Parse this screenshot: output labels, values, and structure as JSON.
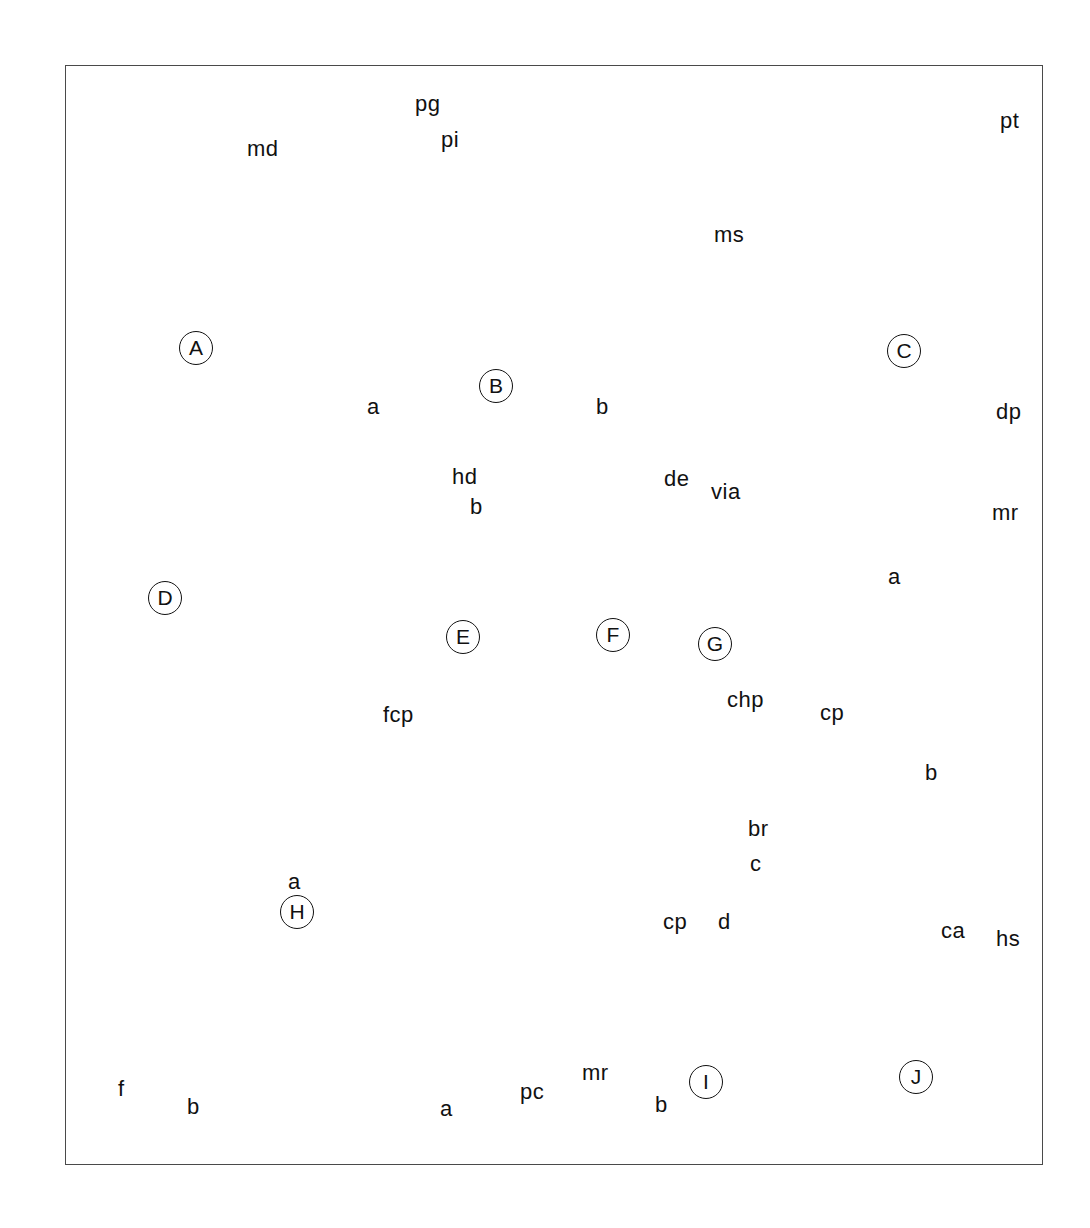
{
  "plate": {
    "title": "Fossil brachiopod / bivalve illustration plate",
    "frame": {
      "x": 65,
      "y": 65,
      "width": 978,
      "height": 1100,
      "border_color": "#4a4a4a"
    },
    "background_color": "#ffffff",
    "ink_color": "#111111"
  },
  "panels": [
    {
      "id": "A",
      "letter": "A",
      "x": 196,
      "y": 348,
      "sublabels": []
    },
    {
      "id": "B",
      "letter": "B",
      "x": 496,
      "y": 386,
      "sublabels": [
        {
          "text": "a",
          "x": 367,
          "y": 405
        },
        {
          "text": "b",
          "x": 596,
          "y": 405
        }
      ]
    },
    {
      "id": "C",
      "letter": "C",
      "x": 904,
      "y": 351,
      "sublabels": []
    },
    {
      "id": "D",
      "letter": "D",
      "x": 165,
      "y": 598,
      "sublabels": []
    },
    {
      "id": "E",
      "letter": "E",
      "x": 463,
      "y": 637,
      "sublabels": []
    },
    {
      "id": "F",
      "letter": "F",
      "x": 613,
      "y": 635,
      "sublabels": []
    },
    {
      "id": "G",
      "letter": "G",
      "x": 715,
      "y": 644,
      "sublabels": [
        {
          "text": "a",
          "x": 888,
          "y": 575
        },
        {
          "text": "b",
          "x": 925,
          "y": 771
        },
        {
          "text": "c",
          "x": 750,
          "y": 862
        }
      ]
    },
    {
      "id": "H",
      "letter": "H",
      "x": 297,
      "y": 912,
      "sublabels": [
        {
          "text": "a",
          "x": 288,
          "y": 880
        },
        {
          "text": "b",
          "x": 187,
          "y": 1105
        }
      ]
    },
    {
      "id": "I",
      "letter": "I",
      "x": 706,
      "y": 1082,
      "sublabels": [
        {
          "text": "a",
          "x": 440,
          "y": 1107
        },
        {
          "text": "b",
          "x": 655,
          "y": 1103
        }
      ]
    },
    {
      "id": "J",
      "letter": "J",
      "x": 916,
      "y": 1077,
      "sublabels": []
    }
  ],
  "annotations": [
    {
      "code": "md",
      "panel": "A",
      "x": 247,
      "y": 149,
      "anchor_x": 178,
      "anchor_y": 213
    },
    {
      "code": "pg",
      "panel": "B",
      "x": 415,
      "y": 104,
      "anchor_x": 330,
      "anchor_y": 135
    },
    {
      "code": "pi",
      "panel": "B",
      "x": 441,
      "y": 139,
      "anchor_x": 342,
      "anchor_y": 155
    },
    {
      "code": "ms",
      "panel": "B",
      "x": 714,
      "y": 234,
      "anchor_x": 608,
      "anchor_y": 285
    },
    {
      "code": "pt",
      "panel": "C",
      "x": 1000,
      "y": 121,
      "anchor_x": 884,
      "anchor_y": 178
    },
    {
      "code": "hd",
      "panel": "E",
      "x": 452,
      "y": 477,
      "anchor_x": 397,
      "anchor_y": 508
    },
    {
      "code": "b",
      "panel": "E",
      "x": 470,
      "y": 507,
      "anchor_x": 381,
      "anchor_y": 552
    },
    {
      "code": "de",
      "panel": "F",
      "x": 664,
      "y": 479,
      "anchor_x": 623,
      "anchor_y": 517
    },
    {
      "code": "via",
      "panel": "F",
      "x": 711,
      "y": 492,
      "anchor_x": 650,
      "anchor_y": 522
    },
    {
      "code": "dp",
      "panel": "G",
      "x": 996,
      "y": 412,
      "anchor_x": 900,
      "anchor_y": 468
    },
    {
      "code": "mr",
      "panel": "G",
      "x": 992,
      "y": 513,
      "anchor_x": 865,
      "anchor_y": 497
    },
    {
      "code": "fcp",
      "panel": "H",
      "x": 383,
      "y": 715,
      "anchor_x": 317,
      "anchor_y": 757
    },
    {
      "code": "chp",
      "panel": "G",
      "x": 742,
      "y": 700,
      "anchor_x": 757,
      "anchor_y": 750
    },
    {
      "code": "cp",
      "panel": "G",
      "x": 820,
      "y": 713,
      "anchor_x": 768,
      "anchor_y": 755
    },
    {
      "code": "br",
      "panel": "G",
      "x": 755,
      "y": 828,
      "anchor_x": 728,
      "anchor_y": 782
    },
    {
      "code": "f",
      "panel": "H",
      "x": 123,
      "y": 1089,
      "anchor_x": 178,
      "anchor_y": 1041
    },
    {
      "code": "pc",
      "panel": "I",
      "x": 520,
      "y": 1092,
      "anchor_x": 462,
      "anchor_y": 1030
    },
    {
      "code": "cp",
      "panel": "I",
      "x": 673,
      "y": 922,
      "anchor_x": 652,
      "anchor_y": 974
    },
    {
      "code": "d",
      "panel": "I",
      "x": 724,
      "y": 922,
      "anchor_x": 700,
      "anchor_y": 969
    },
    {
      "code": "mr",
      "panel": "I",
      "x": 589,
      "y": 1072,
      "anchor_x": 653,
      "anchor_y": 1022
    },
    {
      "code": "ca",
      "panel": "J",
      "x": 951,
      "y": 931,
      "anchor_x": 886,
      "anchor_y": 973
    },
    {
      "code": "hs",
      "panel": "J",
      "x": 1004,
      "y": 937,
      "anchor_x": 957,
      "anchor_y": 969
    }
  ]
}
